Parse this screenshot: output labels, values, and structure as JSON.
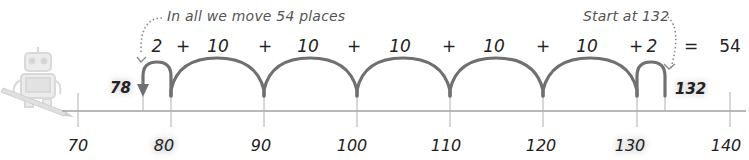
{
  "diagram": {
    "type": "open-number-line",
    "notes": {
      "total": "In all we move 54 places",
      "start": "Start at 132"
    },
    "start_value": "132",
    "end_value": "78",
    "ticks": [
      {
        "value": "70",
        "x": 78,
        "highlight": false
      },
      {
        "value": "80",
        "x": 171,
        "highlight": true
      },
      {
        "value": "90",
        "x": 264,
        "highlight": false
      },
      {
        "value": "100",
        "x": 357,
        "highlight": false
      },
      {
        "value": "110",
        "x": 450,
        "highlight": false
      },
      {
        "value": "120",
        "x": 543,
        "highlight": false
      },
      {
        "value": "130",
        "x": 637,
        "highlight": true
      },
      {
        "value": "140",
        "x": 730,
        "highlight": false
      }
    ],
    "jumps": [
      {
        "label": "2",
        "from": "80",
        "to": "78"
      },
      {
        "label": "10",
        "from": "90",
        "to": "80"
      },
      {
        "label": "10",
        "from": "100",
        "to": "90"
      },
      {
        "label": "10",
        "from": "110",
        "to": "100"
      },
      {
        "label": "10",
        "from": "120",
        "to": "110"
      },
      {
        "label": "10",
        "from": "130",
        "to": "120"
      },
      {
        "label": "2",
        "from": "132",
        "to": "130"
      }
    ],
    "equation": {
      "terms": [
        "2",
        "+",
        "10",
        "+",
        "10",
        "+",
        "10",
        "+",
        "10",
        "+",
        "10",
        "+",
        "2",
        "=",
        "54"
      ],
      "operator_plus": "+",
      "operator_equals": "=",
      "result": "54"
    },
    "colors": {
      "arc": "#6f6f6f",
      "line": "#9a9a9a",
      "note_text": "#555555",
      "robot": "#d6d6d6"
    },
    "icons": [
      "robot-icon",
      "pencil-icon"
    ]
  }
}
